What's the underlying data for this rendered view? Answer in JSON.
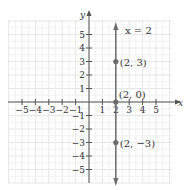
{
  "chart_data": {
    "type": "line",
    "title": "",
    "xlabel": "x",
    "ylabel": "y",
    "xlim": [
      -6,
      6
    ],
    "ylim": [
      -6,
      6
    ],
    "grid": true,
    "x_ticks": [
      -5,
      -4,
      -3,
      -2,
      -1,
      1,
      2,
      3,
      4,
      5
    ],
    "y_ticks": [
      -5,
      -4,
      -3,
      -2,
      -1,
      1,
      2,
      3,
      4,
      5
    ],
    "x_tick_labels": [
      "−5",
      "−4",
      "−3",
      "−2",
      "−1",
      "1",
      "2",
      "3",
      "4",
      "5"
    ],
    "y_tick_labels": [
      "−5",
      "−4",
      "−3",
      "−2",
      "−1",
      "1",
      "2",
      "3",
      "4",
      "5"
    ],
    "series": [
      {
        "name": "x = 2",
        "kind": "vertical-line",
        "x": 2,
        "arrows": "both"
      }
    ],
    "points": [
      {
        "x": 2,
        "y": 3,
        "label": "(2, 3)"
      },
      {
        "x": 2,
        "y": 0,
        "label": "(2, 0)"
      },
      {
        "x": 2,
        "y": -3,
        "label": "(2, −3)"
      }
    ],
    "annotations": [
      {
        "text": "x = 2",
        "x": 3.2,
        "y": 5.4
      }
    ],
    "colors": {
      "grid": "#e6e6e6",
      "axis": "#555555",
      "line": "#6b6b6b",
      "point": "#6b6b6b",
      "text": "#333333"
    }
  },
  "labels": {
    "x_axis": "x",
    "y_axis": "y",
    "equation": "x = 2"
  }
}
